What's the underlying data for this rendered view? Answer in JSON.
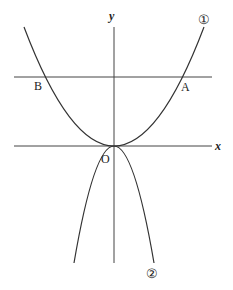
{
  "diagram": {
    "axes": {
      "x_label": "x",
      "y_label": "y",
      "origin_label": "O"
    },
    "curves": [
      {
        "id": "curve-1",
        "label": "①",
        "shape": "upward parabola through origin"
      },
      {
        "id": "curve-2",
        "label": "②",
        "shape": "downward parabola through origin"
      }
    ],
    "horizontal_line": {
      "description": "horizontal line intersecting curve ① at A and B"
    },
    "points": [
      {
        "label": "A",
        "description": "right intersection of horizontal line and curve ①"
      },
      {
        "label": "B",
        "description": "left intersection of horizontal line and curve ①"
      }
    ],
    "colors": {
      "stroke": "#333333",
      "background": "#ffffff"
    }
  }
}
